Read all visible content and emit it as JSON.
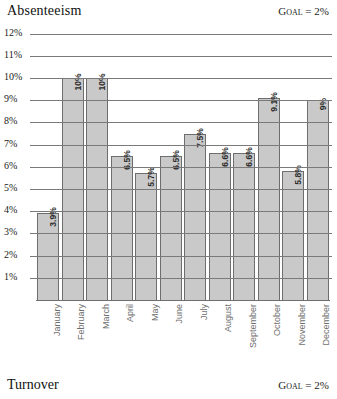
{
  "header": {
    "title": "Absenteeism",
    "goal_label": "Goal = 2%"
  },
  "footer": {
    "title": "Turnover",
    "goal_label": "Goal = 2%"
  },
  "chart_data": {
    "type": "bar",
    "title": "Absenteeism",
    "xlabel": "",
    "ylabel": "",
    "ylim": [
      0,
      12
    ],
    "grid": true,
    "legend": "none",
    "goal_value": 2,
    "goal_text": "Goal = 2%",
    "bar_color": "#c9c9c9",
    "bar_border_color": "#6e6e6e",
    "gridline_color": "#7a7a7a",
    "label_color": "#6e6e6e",
    "yticks": [
      "12%",
      "11%",
      "10%",
      "9%",
      "8%",
      "7%",
      "6%",
      "5%",
      "4%",
      "3%",
      "2%",
      "1%"
    ],
    "ytick_values": [
      12,
      11,
      10,
      9,
      8,
      7,
      6,
      5,
      4,
      3,
      2,
      1
    ],
    "categories": [
      "January",
      "February",
      "March",
      "April",
      "May",
      "June",
      "July",
      "August",
      "September",
      "October",
      "November",
      "December"
    ],
    "values": [
      3.9,
      10,
      10,
      6.5,
      5.7,
      6.5,
      7.5,
      6.6,
      6.6,
      9.1,
      5.8,
      9
    ],
    "data_labels": [
      "3.9%",
      "10%",
      "10%",
      "6.5%",
      "5.7%",
      "6.5%",
      "7.5%",
      "6.6%",
      "6.6%",
      "9.1%",
      "5.8%",
      "9%"
    ]
  }
}
